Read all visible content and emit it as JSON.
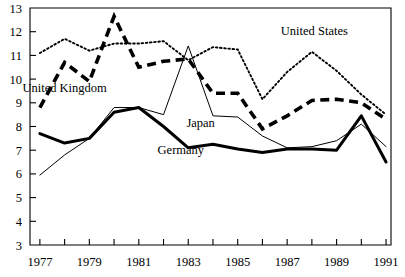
{
  "chart_data": {
    "type": "line",
    "title": "",
    "subtitle": "",
    "xlabel": "",
    "ylabel": "",
    "xlim": [
      1976.6,
      1991.2
    ],
    "ylim": [
      3,
      13
    ],
    "grid": false,
    "legend_position": "inline-annotations",
    "y_ticks": [
      "13",
      "12",
      "11",
      "10",
      "9",
      "8",
      "7",
      "6",
      "5",
      "4",
      "3"
    ],
    "y_tick_values": [
      13,
      12,
      11,
      10,
      9,
      8,
      7,
      6,
      5,
      4,
      3
    ],
    "x_ticks": [
      "1977",
      "",
      "1979",
      "",
      "1981",
      "",
      "1983",
      "",
      "1985",
      "",
      "1987",
      "",
      "1989",
      "",
      "1991"
    ],
    "x_tick_values": [
      1977,
      1978,
      1979,
      1980,
      1981,
      1982,
      1983,
      1984,
      1985,
      1986,
      1987,
      1988,
      1989,
      1990,
      1991
    ],
    "x": [
      1977,
      1978,
      1979,
      1980,
      1981,
      1982,
      1983,
      1984,
      1985,
      1986,
      1987,
      1988,
      1989,
      1990,
      1991
    ],
    "series": [
      {
        "name": "United States",
        "style": "dotted",
        "label_x": 1988.1,
        "label_y": 11.85,
        "values": [
          11.1,
          11.7,
          11.2,
          11.5,
          11.5,
          11.6,
          10.8,
          11.35,
          11.25,
          9.15,
          10.3,
          11.15,
          10.35,
          9.35,
          8.5
        ]
      },
      {
        "name": "United Kingdom",
        "style": "dashed-thick",
        "label_x": 1978.0,
        "label_y": 9.45,
        "values": [
          8.8,
          10.7,
          9.9,
          12.65,
          10.5,
          10.75,
          10.85,
          9.4,
          9.4,
          7.9,
          8.45,
          9.1,
          9.15,
          9.0,
          8.3
        ]
      },
      {
        "name": "Japan",
        "style": "solid-thin",
        "label_x": 1983.5,
        "label_y": 8.0,
        "values": [
          5.95,
          6.8,
          7.5,
          8.8,
          8.8,
          8.5,
          11.4,
          8.45,
          8.4,
          7.6,
          7.1,
          7.15,
          7.4,
          8.1,
          7.15
        ]
      },
      {
        "name": "Germany",
        "style": "solid-thick",
        "label_x": 1982.7,
        "label_y": 6.85,
        "values": [
          7.7,
          7.3,
          7.5,
          8.6,
          8.8,
          8.0,
          7.1,
          7.25,
          7.05,
          6.9,
          7.05,
          7.05,
          7.0,
          8.45,
          6.5
        ]
      }
    ]
  },
  "plot_geometry": {
    "left": 30,
    "right": 391,
    "top": 8,
    "bottom": 245
  }
}
